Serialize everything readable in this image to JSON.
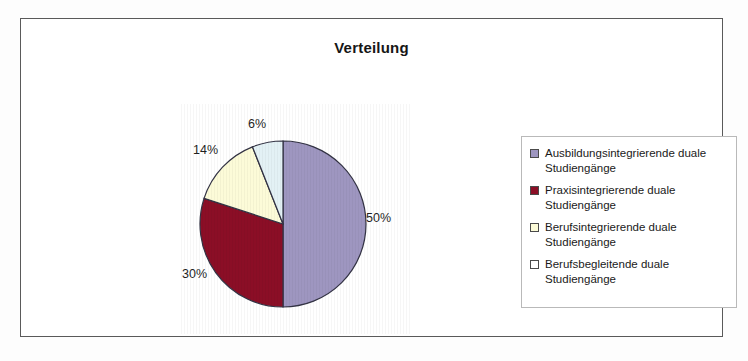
{
  "chart": {
    "title": "Verteilung"
  },
  "chart_data": {
    "type": "pie",
    "title": "Verteilung",
    "xlabel": "",
    "ylabel": "",
    "legend_position": "right",
    "grid": false,
    "categories": [
      "Ausbildungsintegrierende duale Studiengänge",
      "Praxisintegrierende duale Studiengänge",
      "Berufsintegrierende duale Studiengänge",
      "Berufsbegleitende duale Studiengänge"
    ],
    "values": [
      50,
      30,
      14,
      6
    ],
    "value_labels": [
      "50%",
      "30%",
      "14%",
      "6%"
    ],
    "colors": [
      "#9E96C0",
      "#8B0E26",
      "#FCFBD8",
      "#E3F1F5"
    ],
    "start_angle_deg": 0,
    "direction": "clockwise"
  },
  "slice_labels": {
    "s1": "50%",
    "s2": "30%",
    "s3": "14%",
    "s4": "6%"
  },
  "legend": {
    "items": [
      {
        "line1": "Ausbildungsintegrierende duale",
        "line2": "Studiengänge",
        "color": "#9E96C0"
      },
      {
        "line1": "Praxisintegrierende duale",
        "line2": "Studiengänge",
        "color": "#8B0E26"
      },
      {
        "line1": "Berufsintegrierende duale",
        "line2": "Studiengänge",
        "color": "#FCFBD8"
      },
      {
        "line1": "Berufsbegleitende duale",
        "line2": "Studiengänge",
        "color": "#FFFFFF"
      }
    ]
  },
  "style": {
    "frame_border": "#5a5a5a",
    "legend_border": "#b9b9b9",
    "slice_outline": "#333344"
  }
}
